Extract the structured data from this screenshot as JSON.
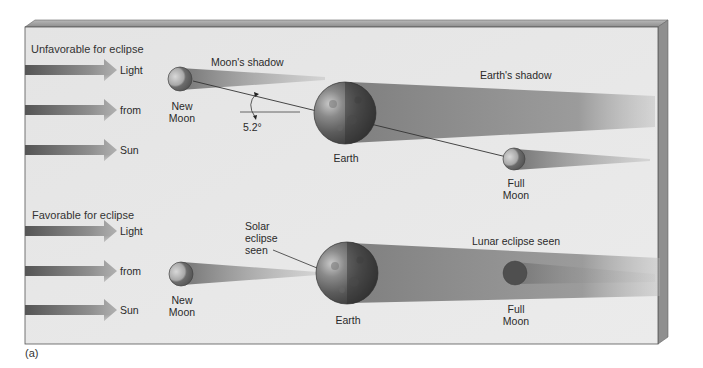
{
  "figure": {
    "caption": "(a)",
    "colors": {
      "board": "#e6e6e6",
      "board_edge": "#8a8a8a",
      "board_side": "#9a9a9a",
      "arrow_dark": "#5a5a5a",
      "arrow_light": "#a8a8a8",
      "shadow": "#8c8c8c",
      "earth": "#6f6f6f",
      "text": "#2a2a2a"
    }
  },
  "panels": [
    {
      "title": "Unfavorable for eclipse",
      "light_arrows": [
        "Light",
        "from",
        "Sun"
      ],
      "new_moon": "New\nMoon",
      "new_moon_lines": [
        "New",
        "Moon"
      ],
      "moon_shadow_label": "Moon's shadow",
      "angle_label": "5.2°",
      "earth_label": "Earth",
      "earth_shadow_label": "Earth's shadow",
      "full_moon_lines": [
        "Full",
        "Moon"
      ]
    },
    {
      "title": "Favorable for eclipse",
      "light_arrows": [
        "Light",
        "from",
        "Sun"
      ],
      "new_moon_lines": [
        "New",
        "Moon"
      ],
      "solar_eclipse_lines": [
        "Solar",
        "eclipse",
        "seen"
      ],
      "earth_label": "Earth",
      "lunar_eclipse_label": "Lunar eclipse seen",
      "full_moon_lines": [
        "Full",
        "Moon"
      ]
    }
  ]
}
